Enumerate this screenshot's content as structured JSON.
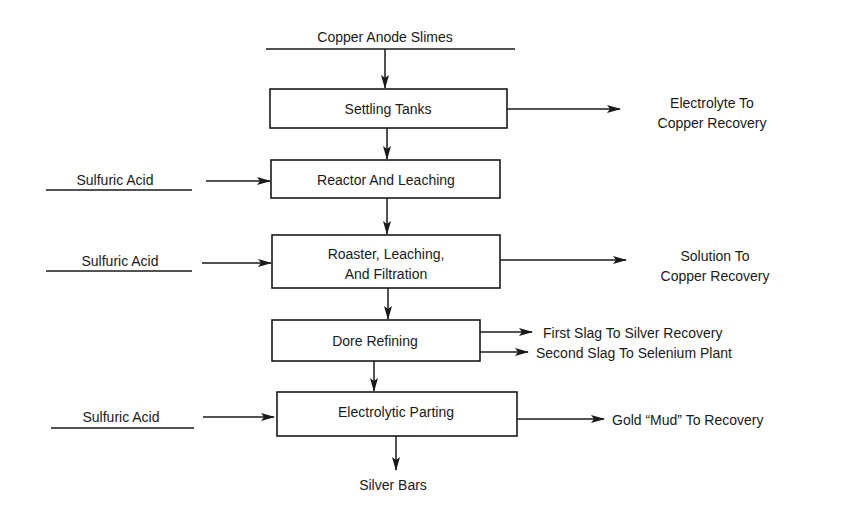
{
  "diagram": {
    "type": "process-flowchart",
    "input": {
      "label": "Copper Anode Slimes"
    },
    "steps": [
      {
        "label_lines": [
          "Settling Tanks"
        ]
      },
      {
        "label_lines": [
          "Reactor And Leaching"
        ]
      },
      {
        "label_lines": [
          "Roaster, Leaching,",
          "And Filtration"
        ]
      },
      {
        "label_lines": [
          "Dore Refining"
        ]
      },
      {
        "label_lines": [
          "Electrolytic Parting"
        ]
      }
    ],
    "side_inputs": [
      {
        "label": "Sulfuric Acid",
        "target_step": 1
      },
      {
        "label": "Sulfuric Acid",
        "target_step": 2
      },
      {
        "label": "Sulfuric Acid",
        "target_step": 4
      }
    ],
    "side_outputs": [
      {
        "label_lines": [
          "Electrolyte To",
          "Copper Recovery"
        ],
        "source_step": 0
      },
      {
        "label_lines": [
          "Solution To",
          "Copper Recovery"
        ],
        "source_step": 2
      },
      {
        "label_lines": [
          "First Slag To Silver Recovery"
        ],
        "source_step": 3
      },
      {
        "label_lines": [
          "Second Slag To Selenium Plant"
        ],
        "source_step": 3
      },
      {
        "label_lines": [
          "Gold “Mud” To Recovery"
        ],
        "source_step": 4
      }
    ],
    "final_output": {
      "label": "Silver Bars"
    },
    "colors": {
      "ink": "#1a1a1a",
      "background": "#ffffff"
    }
  }
}
